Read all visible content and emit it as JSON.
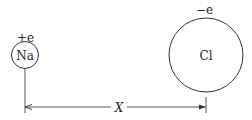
{
  "diagram": {
    "na_ion": {
      "label": "Na",
      "charge": "+e"
    },
    "cl_ion": {
      "label": "Cl",
      "charge": "−e"
    },
    "distance_label": "X"
  },
  "colors": {
    "stroke": "#333333",
    "text": "#2a2a2a",
    "background": "#ffffff"
  }
}
